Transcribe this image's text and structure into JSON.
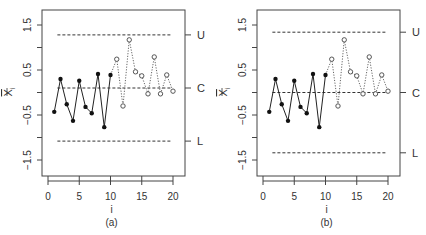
{
  "chart_data": [
    {
      "type": "line",
      "panel_label": "(a)",
      "xlabel": "i",
      "ylabel": "X̄i",
      "xlim": [
        0,
        20
      ],
      "ylim": [
        -1.85,
        1.85
      ],
      "x_ticks": [
        0,
        5,
        10,
        15,
        20
      ],
      "y_ticks": [
        "-1.5",
        "-0.5",
        "0.5",
        "1.5"
      ],
      "grid": false,
      "control_limits": {
        "U": 1.28,
        "C": 0.1,
        "L": -1.08
      },
      "limit_labels": [
        "U",
        "C",
        "L"
      ],
      "series": [
        {
          "name": "phase 1 (solid, filled points)",
          "x": [
            1,
            2,
            3,
            4,
            5,
            6,
            7,
            8,
            9,
            10
          ],
          "values": [
            -0.43,
            0.3,
            -0.26,
            -0.63,
            0.26,
            -0.32,
            -0.46,
            0.41,
            -0.77,
            0.39
          ]
        },
        {
          "name": "phase 2 (dotted, open points)",
          "x": [
            11,
            12,
            13,
            14,
            15,
            16,
            17,
            18,
            19,
            20
          ],
          "values": [
            0.74,
            -0.3,
            1.17,
            0.46,
            0.37,
            -0.03,
            0.79,
            -0.03,
            0.39,
            0.03
          ]
        }
      ]
    },
    {
      "type": "line",
      "panel_label": "(b)",
      "xlabel": "i",
      "ylabel": "X̄i",
      "xlim": [
        0,
        20
      ],
      "ylim": [
        -1.85,
        1.85
      ],
      "x_ticks": [
        0,
        5,
        10,
        15,
        20
      ],
      "y_ticks": [
        "-1.5",
        "-0.5",
        "0.5",
        "1.5"
      ],
      "grid": false,
      "control_limits": {
        "U": 1.34,
        "C": 0.0,
        "L": -1.34
      },
      "limit_labels": [
        "U",
        "C",
        "L"
      ],
      "series": [
        {
          "name": "phase 1 (solid, filled points)",
          "x": [
            1,
            2,
            3,
            4,
            5,
            6,
            7,
            8,
            9,
            10
          ],
          "values": [
            -0.43,
            0.3,
            -0.26,
            -0.63,
            0.26,
            -0.32,
            -0.46,
            0.41,
            -0.77,
            0.39
          ]
        },
        {
          "name": "phase 2 (dotted, open points)",
          "x": [
            11,
            12,
            13,
            14,
            15,
            16,
            17,
            18,
            19,
            20
          ],
          "values": [
            0.74,
            -0.3,
            1.17,
            0.46,
            0.37,
            -0.03,
            0.79,
            -0.03,
            0.39,
            0.03
          ]
        }
      ]
    }
  ]
}
